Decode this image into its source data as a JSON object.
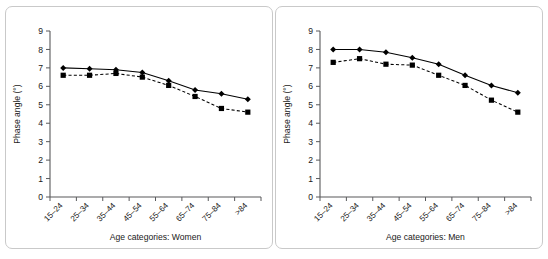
{
  "figure": {
    "panels": [
      "women",
      "men"
    ]
  },
  "chart_data": [
    {
      "type": "line",
      "title": "",
      "xlabel": "Age categories: Women",
      "ylabel": "Phase angle (°)",
      "categories": [
        "15–24",
        "25–34",
        "35–44",
        "45–54",
        "55–64",
        "65–74",
        "75–84",
        ">84"
      ],
      "ylim": [
        0,
        9
      ],
      "yticks": [
        0,
        1,
        2,
        3,
        4,
        5,
        6,
        7,
        8,
        9
      ],
      "grid": false,
      "legend": "none",
      "series": [
        {
          "name": "diamond-solid",
          "marker": "diamond",
          "linestyle": "solid",
          "color": "#000000",
          "values": [
            7.0,
            6.95,
            6.9,
            6.75,
            6.3,
            5.8,
            5.6,
            5.3
          ]
        },
        {
          "name": "square-dashed",
          "marker": "square",
          "linestyle": "dashed",
          "color": "#000000",
          "values": [
            6.6,
            6.6,
            6.7,
            6.5,
            6.05,
            5.45,
            4.8,
            4.6
          ]
        }
      ]
    },
    {
      "type": "line",
      "title": "",
      "xlabel": "Age categories: Men",
      "ylabel": "Phase angle (°)",
      "categories": [
        "15–24",
        "25–34",
        "35–44",
        "45–54",
        "55–64",
        "65–74",
        "75–84",
        ">84"
      ],
      "ylim": [
        0,
        9
      ],
      "yticks": [
        0,
        1,
        2,
        3,
        4,
        5,
        6,
        7,
        8,
        9
      ],
      "grid": false,
      "legend": "none",
      "series": [
        {
          "name": "diamond-solid",
          "marker": "diamond",
          "linestyle": "solid",
          "color": "#000000",
          "values": [
            8.0,
            8.0,
            7.85,
            7.55,
            7.2,
            6.6,
            6.05,
            5.65
          ]
        },
        {
          "name": "square-dashed",
          "marker": "square",
          "linestyle": "dashed",
          "color": "#000000",
          "values": [
            7.3,
            7.5,
            7.2,
            7.15,
            6.6,
            6.05,
            5.25,
            4.6
          ]
        }
      ]
    }
  ]
}
